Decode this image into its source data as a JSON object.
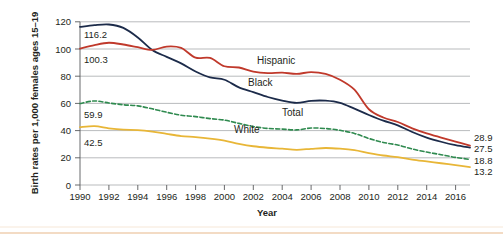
{
  "chart_data": {
    "type": "line",
    "title": "",
    "xlabel": "Year",
    "ylabel": "Birth rates per 1,000 females ages 15–19",
    "xlim": [
      1990,
      2017
    ],
    "ylim": [
      0,
      120
    ],
    "ytick_step": 20,
    "grid": "horizontal",
    "legend": "inline-series-labels",
    "yticks": [
      "0",
      "20",
      "40",
      "60",
      "80",
      "100",
      "120"
    ],
    "xticks": [
      "1990",
      "1992",
      "1994",
      "1996",
      "1998",
      "2000",
      "2002",
      "2004",
      "2006",
      "2008",
      "2010",
      "2012",
      "2014",
      "2016"
    ],
    "x": [
      1990,
      1991,
      1992,
      1993,
      1994,
      1995,
      1996,
      1997,
      1998,
      1999,
      2000,
      2001,
      2002,
      2003,
      2004,
      2005,
      2006,
      2007,
      2008,
      2009,
      2010,
      2011,
      2012,
      2013,
      2014,
      2015,
      2016,
      2017
    ],
    "series": [
      {
        "name": "Black",
        "label": "Black",
        "color": "#1c2b4a",
        "style": "solid",
        "start_label": "116.2",
        "end_label": "27.5",
        "values": [
          116.2,
          117.5,
          118.0,
          115.5,
          108.5,
          99.3,
          94.2,
          89.4,
          83.5,
          79.1,
          77.4,
          71.8,
          68.3,
          64.7,
          62.1,
          60.4,
          61.9,
          62.0,
          60.4,
          56.1,
          51.5,
          47.3,
          43.9,
          39.0,
          34.9,
          31.8,
          29.3,
          27.5
        ]
      },
      {
        "name": "Hispanic",
        "label": "Hispanic",
        "color": "#c0392b",
        "style": "solid",
        "start_label": "100.3",
        "end_label": "28.9",
        "values": [
          100.3,
          102.9,
          104.6,
          103.3,
          101.3,
          99.3,
          101.8,
          100.8,
          93.6,
          93.4,
          87.3,
          86.4,
          83.4,
          82.3,
          82.6,
          81.7,
          83.0,
          81.7,
          77.4,
          70.1,
          55.7,
          49.6,
          46.3,
          41.7,
          38.0,
          34.9,
          31.9,
          28.9
        ]
      },
      {
        "name": "Total",
        "label": "Total",
        "color": "#2f8a4f",
        "style": "dashed",
        "start_label": "59.9",
        "end_label": "18.8",
        "values": [
          59.9,
          61.8,
          60.3,
          59.0,
          58.2,
          56.0,
          53.5,
          51.3,
          50.3,
          48.8,
          47.7,
          45.3,
          43.0,
          41.6,
          41.1,
          40.5,
          41.9,
          41.5,
          40.2,
          37.9,
          34.2,
          31.3,
          29.4,
          26.5,
          24.2,
          22.3,
          20.3,
          18.8
        ]
      },
      {
        "name": "White",
        "label": "White",
        "color": "#e8b637",
        "style": "solid",
        "start_label": "42.5",
        "end_label": "13.2",
        "values": [
          42.5,
          43.3,
          41.7,
          40.7,
          40.4,
          39.3,
          37.6,
          36.0,
          35.2,
          34.1,
          32.6,
          30.3,
          28.5,
          27.4,
          26.7,
          25.9,
          26.6,
          27.2,
          26.7,
          25.6,
          23.5,
          21.7,
          20.5,
          18.6,
          17.3,
          16.0,
          14.6,
          13.2
        ]
      }
    ]
  }
}
